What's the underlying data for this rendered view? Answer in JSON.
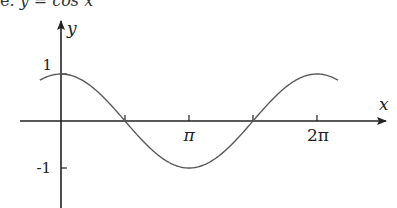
{
  "caption": {
    "prefix": "e.",
    "equation": "y = cos x"
  },
  "chart_data": {
    "type": "line",
    "title": "y = cos x",
    "function": "cos",
    "xlabel": "x",
    "ylabel": "y",
    "x_ticks": [
      {
        "value": 3.14159,
        "label": "π"
      },
      {
        "value": 6.28318,
        "label": "2π"
      }
    ],
    "x_minor_ticks": [
      1.5708,
      4.7124
    ],
    "y_ticks": [
      {
        "value": 1,
        "label": "1"
      },
      {
        "value": -1,
        "label": "-1"
      }
    ],
    "x_range": [
      -0.52,
      6.8
    ],
    "ylim": [
      -1.9,
      2.1
    ],
    "grid": false,
    "legend": null,
    "series": [
      {
        "name": "cos x",
        "color": "#555555",
        "x": [
          -0.5,
          0,
          1.5708,
          3.14159,
          4.7124,
          6.28318,
          6.75
        ],
        "values": [
          0.878,
          1,
          0,
          -1,
          0,
          1,
          0.89
        ]
      }
    ]
  },
  "axes": {
    "origin_px": [
      61,
      121
    ],
    "x_unit_px": 40.74,
    "y_unit_px": 47,
    "color": "#222222",
    "curve_color": "#5a5a5a"
  }
}
